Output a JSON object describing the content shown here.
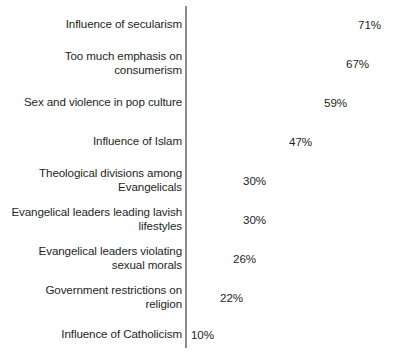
{
  "chart_data": {
    "type": "bar",
    "orientation": "horizontal",
    "title": "",
    "subtitle": "",
    "xlabel": "",
    "ylabel": "",
    "xlim": [
      0,
      71
    ],
    "grid": false,
    "legend": null,
    "value_suffix": "%",
    "categories": [
      "Influence of secularism",
      "Too much emphasis on\nconsumerism",
      "Sex and violence in pop culture",
      "Influence of Islam",
      "Theological divisions among\nEvangelicals",
      "Evangelical leaders leading lavish\nlifestyles",
      "Evangelical leaders violating\nsexual morals",
      "Government restrictions on\nreligion",
      "Influence of Catholicism"
    ],
    "values": [
      71,
      67,
      59,
      47,
      30,
      30,
      26,
      22,
      10
    ],
    "value_labels": [
      "71%",
      "67%",
      "59%",
      "47%",
      "30%",
      "30%",
      "26%",
      "22%",
      "10%"
    ],
    "bars": [
      {
        "label": "Influence of secularism",
        "value": 71,
        "value_label": "71%",
        "bar_px": 203,
        "top_px": 8,
        "height_px": 31
      },
      {
        "label": "Too much emphasis on\nconsumerism",
        "value": 67,
        "value_label": "67%",
        "bar_px": 191,
        "top_px": 47,
        "height_px": 31
      },
      {
        "label": "Sex and violence in pop culture",
        "value": 59,
        "value_label": "59%",
        "bar_px": 169,
        "top_px": 86,
        "height_px": 31
      },
      {
        "label": "Influence of Islam",
        "value": 47,
        "value_label": "47%",
        "bar_px": 134,
        "top_px": 125,
        "height_px": 31
      },
      {
        "label": "Theological divisions among\nEvangelicals",
        "value": 30,
        "value_label": "30%",
        "bar_px": 88,
        "top_px": 164,
        "height_px": 31
      },
      {
        "label": "Evangelical leaders leading lavish\nlifestyles",
        "value": 30,
        "value_label": "30%",
        "bar_px": 88,
        "top_px": 203,
        "height_px": 31
      },
      {
        "label": "Evangelical leaders violating\nsexual morals",
        "value": 26,
        "value_label": "26%",
        "bar_px": 78,
        "top_px": 242,
        "height_px": 31
      },
      {
        "label": "Government restrictions on\nreligion",
        "value": 22,
        "value_label": "22%",
        "bar_px": 65,
        "top_px": 281,
        "height_px": 31
      },
      {
        "label": "Influence of Catholicism",
        "value": 10,
        "value_label": "10%",
        "bar_px": 31,
        "top_px": 320,
        "height_px": 28
      }
    ],
    "colors": {
      "bar_fill": "#d2d2d2",
      "axis_line": "#8c8c8c",
      "text": "#231f20",
      "background": "#ffffff"
    }
  }
}
